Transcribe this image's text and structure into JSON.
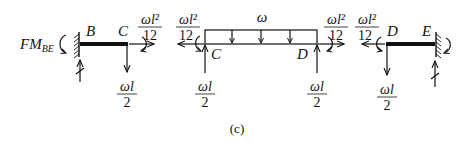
{
  "figure": {
    "caption": "(c)",
    "left_member": {
      "start_node": "B",
      "end_node": "C",
      "support_moment_label": "FM",
      "support_moment_subscript": "BE",
      "end_moment": {
        "numerator": "ωl²",
        "denominator": "12"
      },
      "end_shear": {
        "numerator": "ωl",
        "denominator": "2"
      }
    },
    "middle_member": {
      "load_label": "ω",
      "left_node": "C",
      "right_node": "D",
      "left_moment": {
        "numerator": "ωl²",
        "denominator": "12"
      },
      "right_moment": {
        "numerator": "ωl²",
        "denominator": "12"
      },
      "left_reaction": {
        "numerator": "ωl",
        "denominator": "2"
      },
      "right_reaction": {
        "numerator": "ωl",
        "denominator": "2"
      }
    },
    "right_member": {
      "start_node": "D",
      "end_node": "E",
      "start_moment": {
        "numerator": "ωl²",
        "denominator": "12"
      },
      "start_shear": {
        "numerator": "ωl",
        "denominator": "2"
      }
    }
  }
}
